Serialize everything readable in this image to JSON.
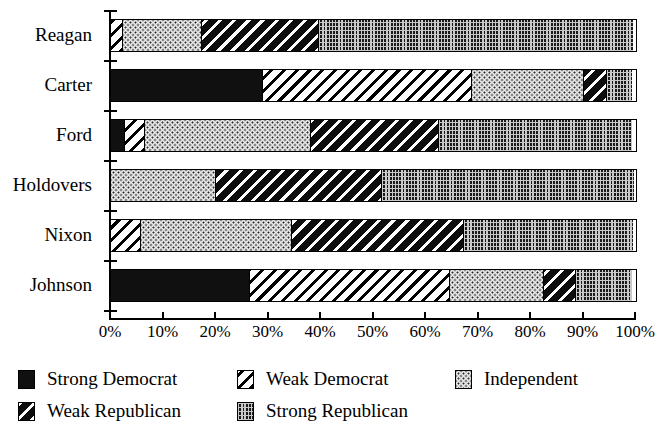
{
  "chart_data": {
    "type": "bar",
    "orientation": "horizontal",
    "stacked": true,
    "normalized": true,
    "title": "",
    "xlabel": "",
    "ylabel": "",
    "xlim": [
      0,
      100
    ],
    "grid": false,
    "legend_position": "bottom",
    "categories": [
      "Reagan",
      "Carter",
      "Ford",
      "Holdovers",
      "Nixon",
      "Johnson"
    ],
    "series": [
      {
        "name": "Strong Democrat",
        "pattern": "solid-black",
        "color": "#101010",
        "values": [
          0,
          29,
          2.7,
          0,
          0,
          26.5
        ]
      },
      {
        "name": "Weak Democrat",
        "pattern": "white-with-black-diagonal-hatch",
        "color": "#ffffff",
        "values": [
          2.3,
          40,
          4,
          0,
          5.7,
          38.3
        ]
      },
      {
        "name": "Independent",
        "pattern": "light-dotted",
        "color": "#e8e8e8",
        "values": [
          15.2,
          21.5,
          31.8,
          20,
          29,
          18.1
        ]
      },
      {
        "name": "Weak Republican",
        "pattern": "black-with-white-diagonal-hatch",
        "color": "#0d0d0d",
        "values": [
          22.5,
          4.5,
          24.5,
          31.8,
          32.9,
          6.2
        ]
      },
      {
        "name": "Strong Republican",
        "pattern": "dark-checkered",
        "color": "#1a1a1a",
        "values": [
          60,
          5,
          37,
          48.2,
          32.4,
          10.9
        ]
      }
    ],
    "x_tick_labels": [
      "0%",
      "10%",
      "20%",
      "30%",
      "40%",
      "50%",
      "60%",
      "70%",
      "80%",
      "90%",
      "100%"
    ],
    "x_tick_values": [
      0,
      10,
      20,
      30,
      40,
      50,
      60,
      70,
      80,
      90,
      100
    ]
  },
  "legend": {
    "items": [
      {
        "label": "Strong Democrat",
        "swatch": "fill-strong-dem"
      },
      {
        "label": "Weak Democrat",
        "swatch": "fill-weak-dem"
      },
      {
        "label": "Independent",
        "swatch": "fill-independent"
      },
      {
        "label": "Weak Republican",
        "swatch": "fill-weak-rep"
      },
      {
        "label": "Strong Republican",
        "swatch": "fill-strong-rep"
      }
    ]
  }
}
